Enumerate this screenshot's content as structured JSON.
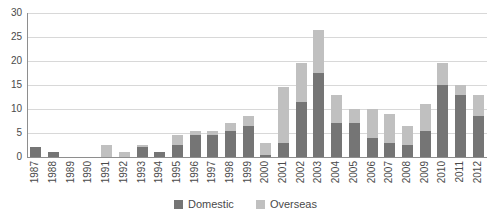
{
  "chart": {
    "y_axis": {
      "tick_labels": [
        "0",
        "5",
        "10",
        "15",
        "20",
        "25",
        "30"
      ],
      "min": 0,
      "max": 30,
      "step": 5
    },
    "colors": {
      "domestic": "#757575",
      "overseas": "#c0c0c0",
      "gridline": "#d8d8d8",
      "axis": "#8e8e8e",
      "text": "#4a4a4a"
    }
  },
  "chart_data": {
    "type": "bar",
    "stacked": true,
    "title": "",
    "xlabel": "",
    "ylabel": "",
    "ylim": [
      0,
      30
    ],
    "grid": true,
    "legend_position": "bottom",
    "categories": [
      "1987",
      "1988",
      "1989",
      "1990",
      "1991",
      "1992",
      "1993",
      "1994",
      "1995",
      "1996",
      "1997",
      "1998",
      "1999",
      "2000",
      "2001",
      "2002",
      "2003",
      "2004",
      "2005",
      "2006",
      "2007",
      "2008",
      "2009",
      "2010",
      "2011",
      "2012"
    ],
    "series": [
      {
        "name": "Domestic",
        "color": "#757575",
        "values": [
          2,
          1,
          0,
          0,
          0,
          0,
          2,
          1,
          2.5,
          4.5,
          4.5,
          5.5,
          6.5,
          0.5,
          3,
          11.5,
          17.5,
          7,
          7,
          4,
          3,
          2.5,
          5.5,
          15,
          13,
          8.5
        ]
      },
      {
        "name": "Overseas",
        "color": "#c0c0c0",
        "values": [
          0,
          0,
          0,
          0,
          2.5,
          1,
          0.5,
          0,
          2,
          1,
          1,
          1.5,
          2,
          2.5,
          11.5,
          8,
          9,
          6,
          3,
          6,
          6,
          4,
          5.5,
          4.5,
          2,
          4.5
        ]
      }
    ]
  }
}
